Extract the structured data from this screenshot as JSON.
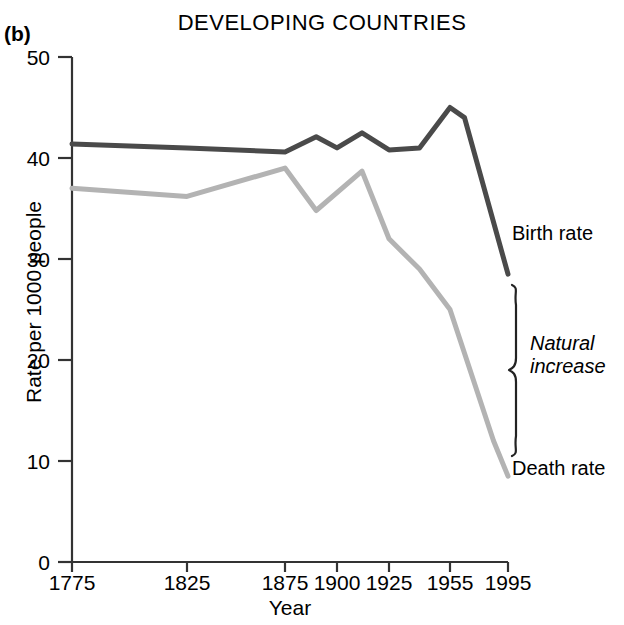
{
  "panel": {
    "label": "(b)"
  },
  "chart_data": {
    "type": "line",
    "title": "DEVELOPING COUNTRIES",
    "xlabel": "Year",
    "ylabel": "Rate per 1000 people",
    "ylim": [
      0,
      50
    ],
    "yticks": [
      0,
      10,
      20,
      30,
      40,
      50
    ],
    "ytick_labels": [
      "0",
      "10",
      "20",
      "30",
      "40",
      "50"
    ],
    "xticks": [
      1775,
      1825,
      1875,
      1900,
      1925,
      1955,
      1995
    ],
    "xtick_labels": [
      "1775",
      "1825",
      "1875",
      "1900",
      "1925",
      "1955",
      "1995"
    ],
    "grid": false,
    "legend_position": "right-inline",
    "series": [
      {
        "name": "Birth rate",
        "color": "#4a4a4a",
        "x": [
          1775,
          1825,
          1875,
          1890,
          1900,
          1912,
          1925,
          1940,
          1955,
          1965,
          1995
        ],
        "values": [
          41.4,
          41.0,
          40.6,
          42.1,
          41.0,
          42.5,
          40.8,
          41.0,
          45.0,
          44.0,
          28.5
        ]
      },
      {
        "name": "Death rate",
        "color": "#b3b3b3",
        "x": [
          1775,
          1825,
          1875,
          1890,
          1912,
          1925,
          1940,
          1955,
          1985,
          1995
        ],
        "values": [
          37.0,
          36.2,
          39.0,
          34.8,
          38.7,
          32.0,
          29.0,
          25.0,
          12.0,
          8.5
        ]
      }
    ],
    "annotations": [
      {
        "text": "Birth rate",
        "style": "normal"
      },
      {
        "text": "Natural",
        "style": "italic"
      },
      {
        "text": "increase",
        "style": "italic"
      },
      {
        "text": "Death rate",
        "style": "normal"
      }
    ]
  },
  "labels": {
    "birth_rate": "Birth rate",
    "natural_increase_line1": "Natural",
    "natural_increase_line2": "increase",
    "death_rate": "Death rate"
  }
}
